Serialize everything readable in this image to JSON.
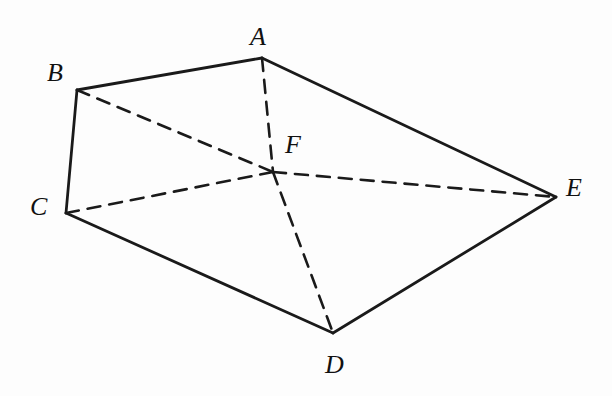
{
  "diagram": {
    "type": "geometry-figure",
    "points": [
      {
        "id": "A",
        "label": "A",
        "x": 262,
        "y": 58,
        "lx": 250,
        "ly": 24
      },
      {
        "id": "B",
        "label": "B",
        "x": 77,
        "y": 90,
        "lx": 47,
        "ly": 60
      },
      {
        "id": "C",
        "label": "C",
        "x": 66,
        "y": 213,
        "lx": 30,
        "ly": 194
      },
      {
        "id": "D",
        "label": "D",
        "x": 333,
        "y": 333,
        "lx": 325,
        "ly": 352
      },
      {
        "id": "E",
        "label": "E",
        "x": 556,
        "y": 197,
        "lx": 566,
        "ly": 175
      },
      {
        "id": "F",
        "label": "F",
        "x": 273,
        "y": 172,
        "lx": 285,
        "ly": 132
      }
    ],
    "solid_edges": [
      [
        "A",
        "B"
      ],
      [
        "B",
        "C"
      ],
      [
        "C",
        "D"
      ],
      [
        "D",
        "E"
      ],
      [
        "E",
        "A"
      ]
    ],
    "dashed_edges": [
      [
        "A",
        "F"
      ],
      [
        "F",
        "D"
      ],
      [
        "B",
        "F"
      ],
      [
        "F",
        "E"
      ],
      [
        "C",
        "F"
      ]
    ]
  }
}
